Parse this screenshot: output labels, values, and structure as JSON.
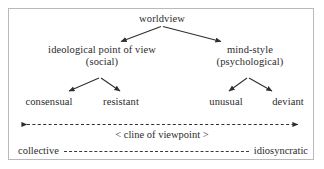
{
  "diagram": {
    "title": "worldview",
    "root": {
      "label": "worldview"
    },
    "branches": [
      {
        "label_line1": "ideological point of view",
        "label_line2": "(social)",
        "children": [
          {
            "label": "consensual"
          },
          {
            "label": "resistant"
          }
        ]
      },
      {
        "label_line1": "mind-style",
        "label_line2": "(psychological)",
        "children": [
          {
            "label": "unusual"
          },
          {
            "label": "deviant"
          }
        ]
      }
    ],
    "scale": {
      "cline_label": "< cline of viewpoint >",
      "left_pole": "collective",
      "right_pole": "idiosyncratic"
    },
    "colors": {
      "text": "#2b2b2b",
      "line": "#2f2f2f",
      "border": "#b9b9b9",
      "background": "#ffffff"
    }
  }
}
